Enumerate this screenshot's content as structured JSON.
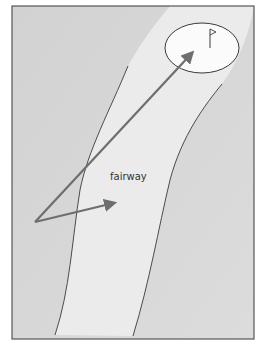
{
  "diagram": {
    "label": "fairway",
    "colors": {
      "rough": "#d6d6d6",
      "fairway": "#ececec",
      "green": "#fbfbfb",
      "line": "#3a3a3a",
      "arrow": "#6e6e6e",
      "border": "#555555"
    },
    "elements": [
      "fairway-boundary-left",
      "fairway-boundary-right",
      "green",
      "flag",
      "shot-arrow-long",
      "shot-arrow-short"
    ]
  }
}
